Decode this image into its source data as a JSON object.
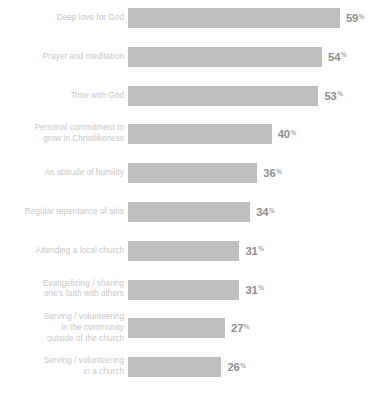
{
  "chart_data": {
    "type": "bar",
    "orientation": "horizontal",
    "title": "",
    "xlabel": "",
    "ylabel": "",
    "unit": "%",
    "xlim": [
      0,
      59
    ],
    "grid": false,
    "legend": false,
    "categories": [
      "Deep love for God",
      "Prayer and meditation",
      "Time with God",
      "Personal commitment to\ngrow in Christlikeness",
      "An attitude of humility",
      "Regular repentance of sins",
      "Attending a local church",
      "Evangelizing / sharing\none's faith with others",
      "Serving / volunteering\nin the community\noutside of the church",
      "Serving / volunteering\nin a church"
    ],
    "values": [
      59,
      54,
      53,
      40,
      36,
      34,
      31,
      31,
      27,
      26
    ],
    "value_labels": [
      "59",
      "54",
      "53",
      "40",
      "36",
      "34",
      "31",
      "31",
      "27",
      "26"
    ],
    "bar_color": "#bfbfbf",
    "label_color": "#c7c7c7",
    "value_color": "#8f8f8f",
    "background": "#ffffff"
  }
}
